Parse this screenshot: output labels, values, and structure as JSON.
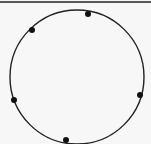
{
  "diagram": {
    "type": "circle-with-points",
    "top_rule": {
      "y": 2,
      "x1": 0,
      "x2": 151,
      "color": "#222222",
      "width": 1.5
    },
    "circle": {
      "cx": 77,
      "cy": 77,
      "r": 67,
      "stroke": "#222222",
      "stroke_width": 1.4
    },
    "points": [
      {
        "x": 88,
        "y": 14
      },
      {
        "x": 32,
        "y": 30
      },
      {
        "x": 14,
        "y": 100
      },
      {
        "x": 140,
        "y": 95
      },
      {
        "x": 66,
        "y": 140
      }
    ],
    "point_radius": 3,
    "point_color": "#111111"
  }
}
